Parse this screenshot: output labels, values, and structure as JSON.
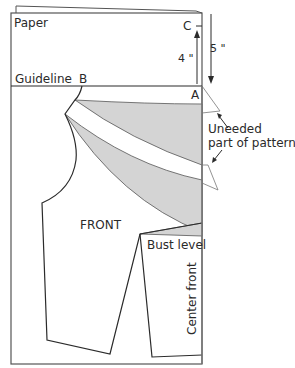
{
  "diagram": {
    "labels": {
      "paper": "Paper",
      "guideline": "Guideline",
      "point_b": "B",
      "point_c": "C",
      "point_a": "A",
      "measure_4": "4 \"",
      "measure_5": "5 \"",
      "uneeded_line1": "Uneeded",
      "uneeded_line2": "part of pattern",
      "front": "FRONT",
      "bust_level": "Bust level",
      "center_front": "Center front"
    },
    "colors": {
      "line": "#2b2b2b",
      "paper_edge": "#7a7a7a",
      "dart_fill": "#d4d4d4",
      "background": "#ffffff"
    }
  }
}
